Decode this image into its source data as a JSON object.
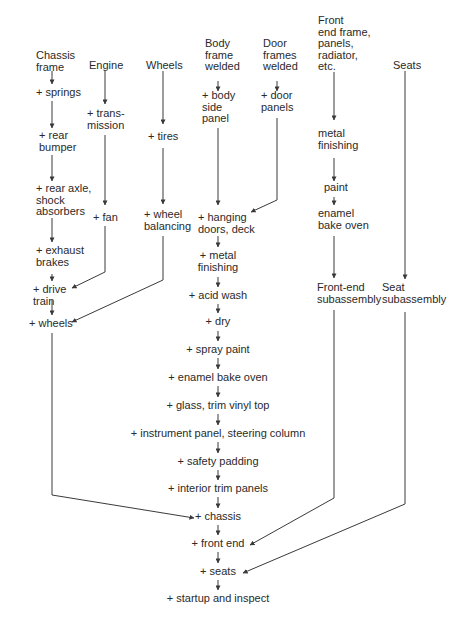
{
  "diagram": {
    "type": "assembly-flowchart",
    "colors": {
      "text": "#2a2a2a",
      "line": "#3a3a3a",
      "background": "#ffffff"
    },
    "columns": {
      "chassis": {
        "start": "Chassis\nframe",
        "steps": [
          "+ springs",
          "+ rear\nbumper",
          "+ rear axle,\nshock\nabsorbers",
          "+ exhaust\nbrakes",
          "+ drive\ntrain",
          "+ wheels"
        ]
      },
      "engine": {
        "start": "Engine",
        "steps": [
          "+ trans-\nmission",
          "+ fan"
        ]
      },
      "wheels": {
        "start": "Wheels",
        "steps": [
          "+ tires",
          "+ wheel\nbalancing"
        ]
      },
      "body": {
        "start": "Body\nframe\nwelded",
        "steps": [
          "+ body\nside\npanel"
        ]
      },
      "doors": {
        "start": "Door\nframes\nwelded",
        "steps": [
          "+ door\npanels"
        ]
      },
      "front_end": {
        "start": "Front\nend frame,\npanels,\nradiator,\netc.",
        "steps": [
          "metal\nfinishing",
          "paint",
          "enamel\nbake oven",
          "Front-end\nsubassembly"
        ]
      },
      "seats": {
        "start": "Seats",
        "steps": [
          "Seat\nsubassembly"
        ]
      },
      "main_line": {
        "steps": [
          "+ hanging\ndoors, deck",
          "+ metal\nfinishing",
          "+ acid wash",
          "+ dry",
          "+ spray paint",
          "+ enamel bake oven",
          "+ glass, trim vinyl top",
          "+ instrument panel, steering column",
          "+ safety padding",
          "+ interior trim panels",
          "+ chassis",
          "+ front end",
          "+ seats",
          "+ startup and inspect"
        ]
      }
    }
  }
}
